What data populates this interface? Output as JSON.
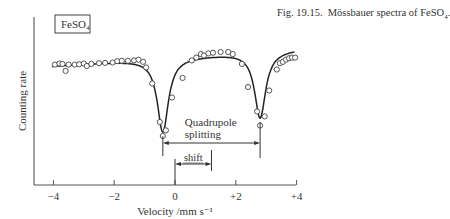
{
  "caption": {
    "prefix": "Fig. 19.15.",
    "text": "Mössbauer spectra of FeSO",
    "subscript": "4",
    "suffix": "."
  },
  "sample_label": {
    "text": "FeSO",
    "subscript": "4"
  },
  "chart_data": {
    "type": "line",
    "title": "Mössbauer spectra of FeSO4",
    "xlabel": "Velocity /mm s⁻¹",
    "ylabel": "Counting rate",
    "xlim": [
      -4.5,
      4.1
    ],
    "xticks": [
      -4,
      -2,
      0,
      2,
      4
    ],
    "xtick_labels": [
      "−4",
      "−2",
      "0",
      "+2",
      "+4"
    ],
    "yticks": [],
    "grid": false,
    "legend": null,
    "series": [
      {
        "name": "measured counts",
        "style": "open-circle markers",
        "points": [
          [
            -3.95,
            0.02
          ],
          [
            -3.8,
            0.035
          ],
          [
            -3.7,
            0.03
          ],
          [
            -3.6,
            -0.07
          ],
          [
            -3.5,
            0.02
          ],
          [
            -3.3,
            0.02
          ],
          [
            -3.15,
            0.025
          ],
          [
            -3.0,
            0.035
          ],
          [
            -2.9,
            0.0
          ],
          [
            -2.75,
            0.03
          ],
          [
            -2.5,
            0.04
          ],
          [
            -2.3,
            0.045
          ],
          [
            -2.05,
            0.05
          ],
          [
            -1.9,
            0.07
          ],
          [
            -1.75,
            0.075
          ],
          [
            -1.55,
            0.075
          ],
          [
            -1.35,
            0.08
          ],
          [
            -1.2,
            0.09
          ],
          [
            -1.05,
            0.06
          ],
          [
            -0.95,
            -0.02
          ],
          [
            -0.75,
            -0.25
          ],
          [
            -0.5,
            -0.8
          ],
          [
            -0.4,
            -1.0
          ],
          [
            -0.3,
            -0.92
          ],
          [
            -0.1,
            -0.45
          ],
          [
            0.25,
            -0.17
          ],
          [
            0.55,
            0.08
          ],
          [
            0.7,
            0.12
          ],
          [
            0.85,
            0.17
          ],
          [
            0.95,
            0.15
          ],
          [
            1.1,
            0.18
          ],
          [
            1.25,
            0.19
          ],
          [
            1.5,
            0.2
          ],
          [
            1.75,
            0.2
          ],
          [
            1.9,
            0.17
          ],
          [
            2.2,
            0.03
          ],
          [
            2.4,
            -0.3
          ],
          [
            2.7,
            -0.65
          ],
          [
            2.8,
            -0.85
          ],
          [
            2.95,
            -0.72
          ],
          [
            3.1,
            -0.35
          ],
          [
            3.35,
            -0.05
          ],
          [
            3.45,
            0.04
          ],
          [
            3.55,
            0.06
          ],
          [
            3.65,
            0.09
          ],
          [
            3.75,
            0.11
          ],
          [
            3.85,
            0.12
          ],
          [
            3.95,
            0.12
          ]
        ]
      },
      {
        "name": "fitted curve",
        "style": "solid line",
        "model": "two Lorentzian doublet lines on sloping baseline",
        "line_positions_mm_s": [
          -0.4,
          2.8
        ],
        "line_depths_rel": [
          1.0,
          0.9
        ],
        "baseline_slope": 0.03
      }
    ],
    "annotations": [
      {
        "label": "Quadrupole",
        "label2": "splitting",
        "type": "double-arrow",
        "from": -0.4,
        "to": 2.8,
        "value_mm_s": 3.2
      },
      {
        "label": "shift",
        "type": "double-arrow",
        "from": 0.0,
        "to": 1.2,
        "value_mm_s": 1.2
      }
    ]
  }
}
